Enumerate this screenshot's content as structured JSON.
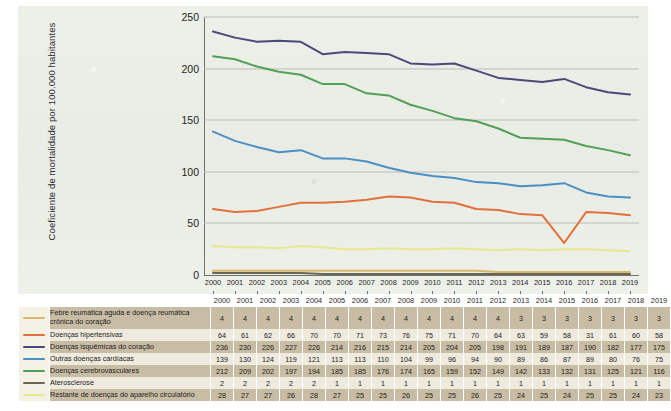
{
  "chart_data": {
    "type": "line",
    "title": "",
    "xlabel": "",
    "ylabel": "Coeficiente de mortalidade por 100.000 habitantes",
    "ylim": [
      0,
      250
    ],
    "yticks": [
      0,
      50,
      100,
      150,
      200,
      250
    ],
    "grid": true,
    "legend_position": "below-table",
    "categories": [
      "2000",
      "2001",
      "2002",
      "2003",
      "2004",
      "2005",
      "2006",
      "2007",
      "2008",
      "2009",
      "2010",
      "2011",
      "2012",
      "2013",
      "2014",
      "2015",
      "2016",
      "2017",
      "2018",
      "2019"
    ],
    "series": [
      {
        "name": "Febre reumática aguda e doença reumática crônica do coração",
        "color": "#d9b86a",
        "values": [
          4,
          4,
          4,
          4,
          4,
          4,
          4,
          4,
          4,
          4,
          4,
          4,
          4,
          3,
          3,
          3,
          3,
          3,
          3,
          3
        ]
      },
      {
        "name": "Doenças hipertensivas",
        "color": "#e2703a",
        "values": [
          64,
          61,
          62,
          66,
          70,
          70,
          71,
          73,
          76,
          75,
          71,
          70,
          64,
          63,
          59,
          58,
          31,
          61,
          60,
          58
        ]
      },
      {
        "name": "Doenças isquêmicas do coração",
        "color": "#4a4a7a",
        "values": [
          236,
          230,
          226,
          227,
          226,
          214,
          216,
          215,
          214,
          205,
          204,
          205,
          198,
          191,
          189,
          187,
          190,
          182,
          177,
          175
        ]
      },
      {
        "name": "Outras doenças cardíacas",
        "color": "#4a90c4",
        "values": [
          139,
          130,
          124,
          119,
          121,
          113,
          113,
          110,
          104,
          99,
          96,
          94,
          90,
          89,
          86,
          87,
          89,
          80,
          76,
          75
        ]
      },
      {
        "name": "Doenças cerebrovasculares",
        "color": "#52a056",
        "values": [
          212,
          209,
          202,
          197,
          194,
          185,
          185,
          176,
          174,
          165,
          159,
          152,
          149,
          142,
          133,
          132,
          131,
          125,
          121,
          116
        ]
      },
      {
        "name": "Aterosclerose",
        "color": "#6b6656",
        "values": [
          2,
          2,
          2,
          2,
          2,
          1,
          1,
          1,
          1,
          1,
          1,
          1,
          1,
          1,
          1,
          1,
          1,
          1,
          1,
          1
        ]
      },
      {
        "name": "Restante de doenças do aparelho circulatório",
        "color": "#e8e88c",
        "values": [
          28,
          27,
          27,
          26,
          28,
          27,
          25,
          25,
          26,
          25,
          25,
          26,
          25,
          24,
          25,
          24,
          25,
          25,
          24,
          23
        ]
      }
    ]
  }
}
